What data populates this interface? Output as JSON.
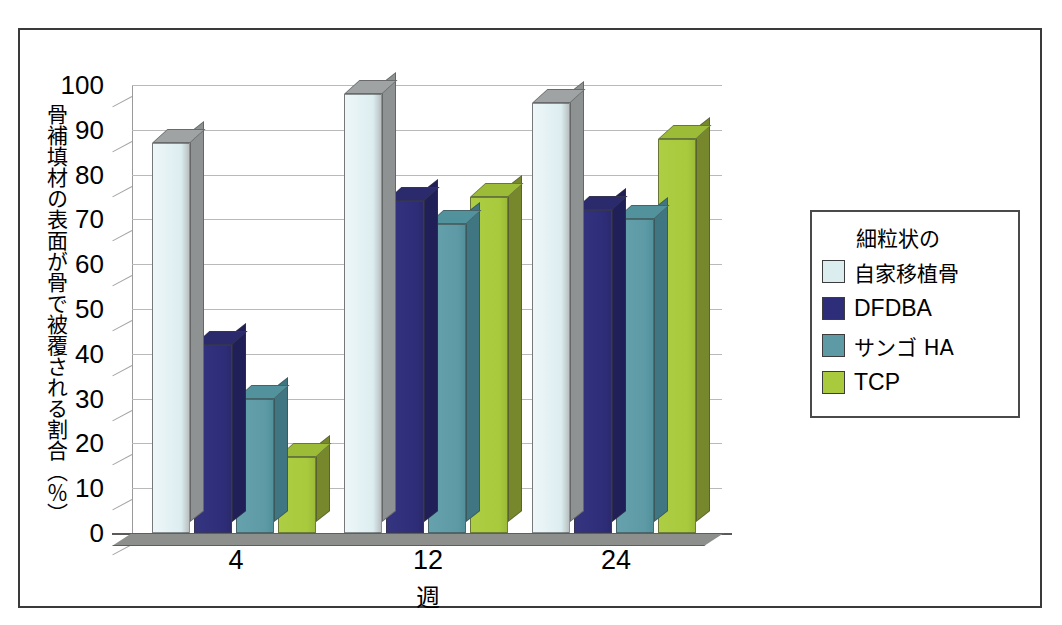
{
  "chart_data": {
    "type": "bar",
    "title": "",
    "subtitle": "",
    "xlabel": "週",
    "ylabel": "骨補填材の表面が骨で被覆される割合（％）",
    "categories": [
      "4",
      "12",
      "24"
    ],
    "ylim": [
      0,
      100
    ],
    "y_ticks": [
      "0",
      "10",
      "20",
      "30",
      "40",
      "50",
      "60",
      "70",
      "80",
      "90",
      "100"
    ],
    "grid": true,
    "legend_position": "right",
    "legend_heading": "細粒状の",
    "series": [
      {
        "name": "自家移植骨",
        "color": "#dcedf0",
        "values": [
          87,
          98,
          96
        ]
      },
      {
        "name": "DFDBA",
        "color": "#2e2d7a",
        "values": [
          42,
          74,
          72
        ]
      },
      {
        "name": "サンゴ HA",
        "color": "#5d9aa6",
        "values": [
          30,
          69,
          70
        ]
      },
      {
        "name": "TCP",
        "color": "#a9ca3c",
        "values": [
          17,
          75,
          88
        ]
      }
    ]
  },
  "legend": {
    "heading": "細粒状の",
    "items": [
      {
        "label": "自家移植骨",
        "color": "#dcedf0",
        "script": "jp"
      },
      {
        "label": "DFDBA",
        "color": "#2e2d7a",
        "script": "latin"
      },
      {
        "label": "サンゴ HA",
        "color": "#5d9aa6",
        "script": "jp"
      },
      {
        "label": "TCP",
        "color": "#a9ca3c",
        "script": "latin"
      }
    ]
  },
  "axes": {
    "y_title": "骨補填材の表面が骨で被覆される割合（％）",
    "x_title": "週",
    "x_labels": [
      "4",
      "12",
      "24"
    ],
    "y_labels": [
      "100",
      "90",
      "80",
      "70",
      "60",
      "50",
      "40",
      "30",
      "20",
      "10",
      "0"
    ]
  },
  "colors": {
    "autograft": "#dcedf0",
    "dfdba": "#2e2d7a",
    "coral_ha": "#5d9aa6",
    "tcp": "#a9ca3c",
    "depth_gray": "#7d8081",
    "frame": "#3a3a3a",
    "grid": "#b9b9b9"
  }
}
